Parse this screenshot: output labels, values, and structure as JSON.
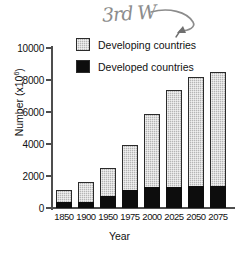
{
  "chart_data": {
    "type": "bar",
    "title": "",
    "subtitle": "",
    "xlabel": "Year",
    "ylabel": "Number (x10^6)",
    "ylabel_base": "Number (x10",
    "ylabel_exp": "6",
    "ylabel_close": ")",
    "categories": [
      "1850",
      "1900",
      "1950",
      "1975",
      "2000",
      "2025",
      "2050",
      "2075"
    ],
    "series": [
      {
        "name": "Developed countries",
        "color": "#0d0d0d",
        "values": [
          350,
          400,
          750,
          1100,
          1300,
          1300,
          1350,
          1400
        ]
      },
      {
        "name": "Developing countries",
        "color": "#b5b5b5",
        "values": [
          800,
          1200,
          1750,
          2850,
          4550,
          6050,
          6850,
          7100
        ]
      }
    ],
    "totals": [
      1150,
      1600,
      2500,
      3950,
      5850,
      7350,
      8200,
      8500
    ],
    "stacked": true,
    "ylim": [
      0,
      10000
    ],
    "yticks": [
      0,
      2000,
      4000,
      6000,
      8000,
      10000
    ],
    "ytick_labels": [
      "0",
      "2000",
      "4000",
      "6000",
      "8000",
      "10000"
    ],
    "grid": false,
    "legend_position": "upper-left-inside"
  },
  "legend": {
    "items": [
      {
        "label": "Developing countries",
        "swatch": "developing"
      },
      {
        "label": "Developed countries",
        "swatch": "developed"
      }
    ]
  },
  "annotation": {
    "handwritten_text": "3rd W",
    "points_to": "Developing countries legend swatch",
    "color": "#8c8c8c"
  }
}
